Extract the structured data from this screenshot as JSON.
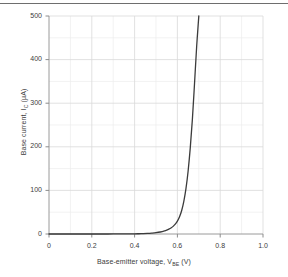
{
  "page": {
    "divider_present": true,
    "background_color": "#ffffff",
    "divider_color": "#6e6e6e"
  },
  "chart_data": {
    "type": "line",
    "title": "",
    "subtitle": "",
    "xlabel": "Base-emitter voltage, V",
    "xlabel_sub": "BE",
    "xlabel_unit": "(V)",
    "xlabel_full": "Base-emitter voltage, V_BE (V)",
    "ylabel": "Base current, I",
    "ylabel_sub": "C",
    "ylabel_unit": "(µA)",
    "ylabel_full": "Base current, I_C (µA)",
    "xlim": [
      0,
      1.0
    ],
    "ylim": [
      0,
      500
    ],
    "xticks": [
      0,
      0.2,
      0.4,
      0.6,
      0.8,
      1.0
    ],
    "xtick_labels": [
      "0",
      "0.2",
      "0.4",
      "0.6",
      "0.8",
      "1.0"
    ],
    "yticks": [
      0,
      100,
      200,
      300,
      400,
      500
    ],
    "ytick_labels": [
      "0",
      "100",
      "200",
      "300",
      "400",
      "500"
    ],
    "grid": true,
    "grid_minor": true,
    "grid_color": "#d9d9d9",
    "grid_minor_color": "#ececec",
    "minor_x_step": 0.1,
    "minor_y_step": 50,
    "legend": null,
    "legend_position": "none",
    "line_color": "#3b3b3b",
    "line_width": 1.3,
    "series": [
      {
        "name": "Base current",
        "x": [
          0.0,
          0.05,
          0.1,
          0.15,
          0.2,
          0.25,
          0.3,
          0.35,
          0.4,
          0.42,
          0.44,
          0.46,
          0.48,
          0.5,
          0.52,
          0.54,
          0.55,
          0.56,
          0.57,
          0.58,
          0.59,
          0.6,
          0.61,
          0.62,
          0.63,
          0.64,
          0.65,
          0.66,
          0.67,
          0.68,
          0.69,
          0.7
        ],
        "y": [
          0.0,
          0.0,
          0.0,
          0.0,
          0.0,
          0.0,
          0.1,
          0.2,
          0.4,
          0.6,
          0.9,
          1.3,
          2.0,
          3.0,
          4.6,
          7.1,
          8.8,
          11.0,
          13.8,
          17.5,
          22.5,
          29.5,
          39.5,
          54.0,
          75.0,
          104.0,
          144.0,
          197.0,
          263.0,
          345.0,
          430.0,
          500.0
        ]
      }
    ],
    "axis_color": "#9a9a9a",
    "tick_color": "#8c8c8c",
    "plot_area": {
      "left": 49,
      "right": 263,
      "top": 16,
      "bottom": 234
    }
  }
}
